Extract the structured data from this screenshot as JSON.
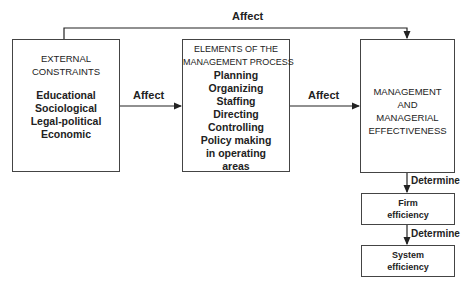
{
  "diagram": {
    "top_arrow_label": "Affect",
    "left_to_middle_label": "Affect",
    "middle_to_right_label": "Affect",
    "right_to_firm_label": "Determine",
    "firm_to_system_label": "Determine",
    "external_constraints": {
      "title_line1": "EXTERNAL",
      "title_line2": "CONSTRAINTS",
      "items": [
        "Educational",
        "Sociological",
        "Legal-political",
        "Economic"
      ]
    },
    "management_process": {
      "title_line1": "ELEMENTS OF THE",
      "title_line2": "MANAGEMENT PROCESS",
      "items": [
        "Planning",
        "Organizing",
        "Staffing",
        "Directing",
        "Controlling",
        "Policy making",
        "in operating",
        "areas"
      ]
    },
    "effectiveness": {
      "lines": [
        "MANAGEMENT",
        "AND",
        "MANAGERIAL",
        "EFFECTIVENESS"
      ]
    },
    "firm_efficiency": {
      "lines": [
        "Firm",
        "efficiency"
      ]
    },
    "system_efficiency": {
      "lines": [
        "System",
        "efficiency"
      ]
    }
  }
}
